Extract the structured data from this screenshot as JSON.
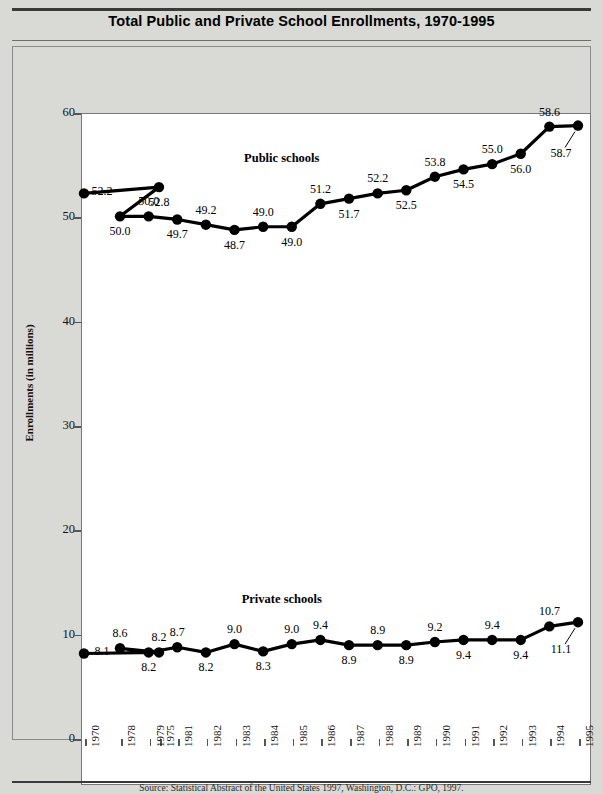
{
  "title": "Total Public and Private School Enrollments, 1970-1995",
  "source_note": "Source: Statistical Abstract of the United States 1997, Washington, D.C.: GPO, 1997.",
  "chart_data": {
    "type": "line",
    "title": "Total Public and Private School Enrollments, 1970-1995",
    "xlabel": "",
    "ylabel": "Enrollments (in millions)",
    "ylim": [
      0,
      60
    ],
    "yticks": [
      0,
      10,
      20,
      30,
      40,
      50,
      60
    ],
    "grid": false,
    "legend_position": "inline-labels",
    "categories": [
      "1970",
      "1975",
      "1978",
      "1979",
      "1981",
      "1982",
      "1983",
      "1984",
      "1985",
      "1986",
      "1987",
      "1988",
      "1989",
      "1990",
      "1991",
      "1992",
      "1993",
      "1994",
      "1995"
    ],
    "series": [
      {
        "name": "Public schools",
        "color": "#000000",
        "values": [
          52.2,
          52.8,
          50.0,
          50.0,
          49.7,
          49.2,
          48.7,
          49.0,
          49.0,
          51.2,
          51.7,
          52.2,
          52.5,
          53.8,
          54.5,
          55.0,
          56.0,
          58.6,
          58.7
        ],
        "label_positions": [
          "below",
          "below",
          "below",
          "above",
          "below",
          "above",
          "below",
          "above",
          "below",
          "above",
          "below",
          "above",
          "below",
          "above",
          "below",
          "above",
          "below",
          "above",
          "leader"
        ]
      },
      {
        "name": "Private schools",
        "color": "#000000",
        "values": [
          8.1,
          8.2,
          8.6,
          8.2,
          8.7,
          8.2,
          9.0,
          8.3,
          9.0,
          9.4,
          8.9,
          8.9,
          8.9,
          9.2,
          9.4,
          9.4,
          9.4,
          10.7,
          11.1
        ],
        "label_positions": [
          "above",
          "above",
          "above",
          "below",
          "above",
          "below",
          "above",
          "below",
          "above",
          "above",
          "below",
          "above",
          "below",
          "above",
          "below",
          "above",
          "below",
          "above",
          "leader"
        ]
      }
    ],
    "annotations": [
      {
        "text": "Public schools",
        "x": "1985",
        "value": 55.5
      },
      {
        "text": "Private schools",
        "x": "1985",
        "value": 13.2
      }
    ]
  }
}
